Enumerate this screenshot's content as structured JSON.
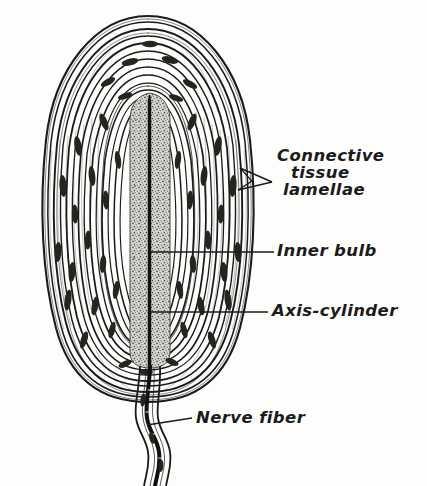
{
  "figure": {
    "style": "black and white ink drawing, italic hand-lettered labels",
    "background_color": "#fdfdfb",
    "ink_color": "#1b1b1b",
    "inner_bulb_fill": "#b9b7b2"
  },
  "labels": {
    "connective_tissue": {
      "line1": "Connective",
      "line2": "tissue",
      "line3": "lamellae",
      "leader": "double-pronged-arrow pointing left into lamellae"
    },
    "inner_bulb": {
      "text": "Inner bulb",
      "leader": "horizontal line to inner bulb"
    },
    "axis_cylinder": {
      "text": "Axis-cylinder",
      "leader": "horizontal line to central dark axis line"
    },
    "nerve_fiber": {
      "text": "Nerve fiber",
      "leader": "horizontal line to nerve stalk"
    }
  },
  "structures": {
    "capsule": {
      "name": "lamellated capsule",
      "lamellae_count": 17,
      "outline": "tall oval, top rounded, bottom tapering to nerve stalk"
    },
    "inner_bulb": {
      "name": "inner bulb",
      "texture": "stippled granular column"
    },
    "axis_cylinder": {
      "name": "axis-cylinder",
      "appearance": "solid black central line"
    },
    "nuclei": {
      "name": "lamellar cell nuclei",
      "appearance": "dark elongated spindles"
    },
    "nerve_fiber": {
      "name": "nerve fiber",
      "appearance": "wavy sheathed stalk with dark core"
    }
  }
}
